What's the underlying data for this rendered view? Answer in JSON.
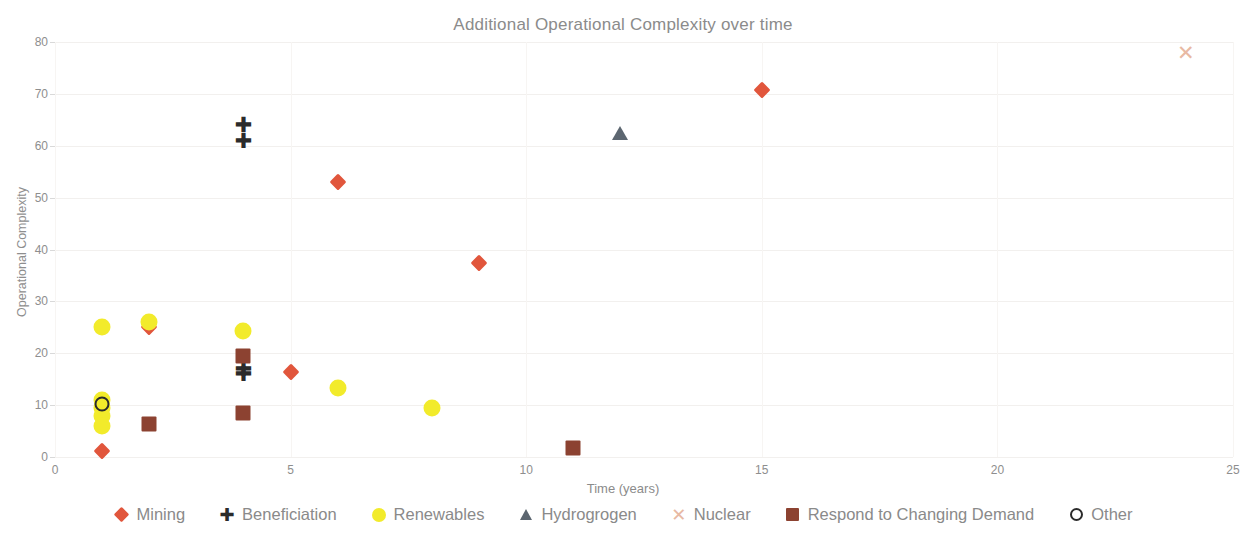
{
  "chart_data": {
    "type": "scatter",
    "title": "Additional Operational Complexity over time",
    "xlabel": "Time (years)",
    "ylabel": "Operational Complexity",
    "xlim": [
      0,
      25
    ],
    "ylim": [
      0,
      80
    ],
    "xticks": [
      0,
      5,
      10,
      15,
      20,
      25
    ],
    "yticks": [
      0,
      10,
      20,
      30,
      40,
      50,
      60,
      70,
      80
    ],
    "grid": "faint-horizontal-and-vertical",
    "legend_position": "bottom",
    "series": [
      {
        "name": "Mining",
        "marker": "diamond",
        "color": "#E1563C",
        "points": [
          {
            "x": 1,
            "y": 1.2
          },
          {
            "x": 2,
            "y": 25.0
          },
          {
            "x": 5,
            "y": 16.3
          },
          {
            "x": 6,
            "y": 53.0
          },
          {
            "x": 9,
            "y": 37.4
          },
          {
            "x": 15,
            "y": 70.7
          }
        ]
      },
      {
        "name": "Beneficiation",
        "marker": "plus",
        "color": "#2B2B2B",
        "points": [
          {
            "x": 4,
            "y": 64.0
          },
          {
            "x": 4,
            "y": 61.0
          },
          {
            "x": 4,
            "y": 17.0
          },
          {
            "x": 4,
            "y": 16.0
          }
        ]
      },
      {
        "name": "Renewables",
        "marker": "circle",
        "color": "#F2EB2B",
        "points": [
          {
            "x": 1,
            "y": 25.0
          },
          {
            "x": 1,
            "y": 11.0
          },
          {
            "x": 1,
            "y": 9.5
          },
          {
            "x": 1,
            "y": 8.0
          },
          {
            "x": 1,
            "y": 6.0
          },
          {
            "x": 2,
            "y": 26.0
          },
          {
            "x": 4,
            "y": 24.2
          },
          {
            "x": 6,
            "y": 13.3
          },
          {
            "x": 8,
            "y": 9.5
          }
        ]
      },
      {
        "name": "Hydrogrogen",
        "marker": "triangle",
        "color": "#5C6670",
        "points": [
          {
            "x": 12,
            "y": 62.4
          }
        ]
      },
      {
        "name": "Nuclear",
        "marker": "cross",
        "color": "#E8B9A3",
        "points": [
          {
            "x": 24,
            "y": 77.8
          }
        ]
      },
      {
        "name": "Respond to Changing Demand",
        "marker": "square",
        "color": "#8C4231",
        "points": [
          {
            "x": 2,
            "y": 6.4
          },
          {
            "x": 4,
            "y": 19.5
          },
          {
            "x": 4,
            "y": 8.5
          },
          {
            "x": 11,
            "y": 1.7
          }
        ]
      },
      {
        "name": "Other",
        "marker": "ring",
        "color": "#2B2B2B",
        "points": [
          {
            "x": 1,
            "y": 10.2
          }
        ]
      }
    ]
  },
  "legend": {
    "items": [
      {
        "label": "Mining",
        "marker": "diamond",
        "color": "#E1563C"
      },
      {
        "label": "Beneficiation",
        "marker": "plus",
        "color": "#2B2B2B"
      },
      {
        "label": "Renewables",
        "marker": "circle",
        "color": "#F2EB2B"
      },
      {
        "label": "Hydrogrogen",
        "marker": "triangle",
        "color": "#5C6670"
      },
      {
        "label": "Nuclear",
        "marker": "cross",
        "color": "#E8B9A3"
      },
      {
        "label": "Respond to Changing Demand",
        "marker": "square",
        "color": "#8C4231"
      },
      {
        "label": "Other",
        "marker": "ring",
        "color": "#2B2B2B"
      }
    ]
  }
}
